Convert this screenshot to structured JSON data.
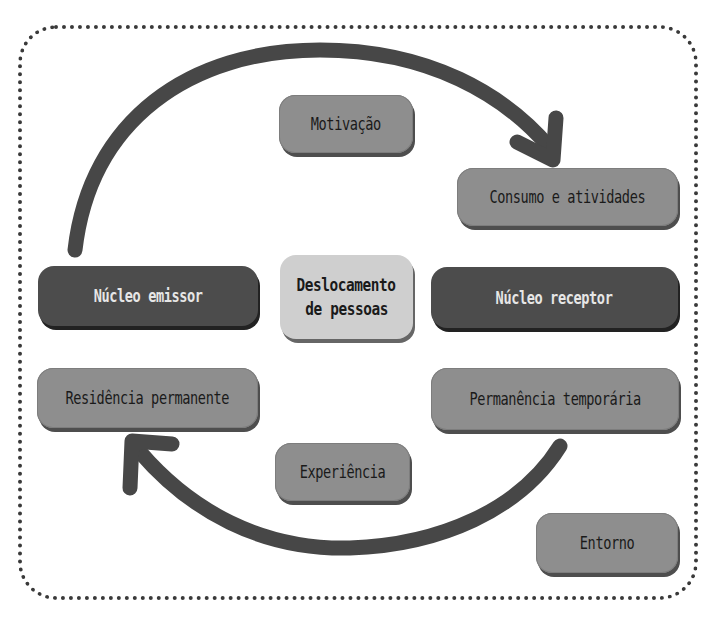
{
  "diagram": {
    "center": {
      "line1": "Deslocamento",
      "line2": "de pessoas"
    },
    "nodes": {
      "motivacao": "Motivação",
      "consumo": "Consumo e atividades",
      "nucleo_emissor": "Núcleo emissor",
      "nucleo_receptor": "Núcleo receptor",
      "residencia": "Residência permanente",
      "permanencia": "Permanência temporária",
      "experiencia": "Experiência",
      "entorno": "Entorno"
    },
    "arrows": [
      {
        "from": "nucleo_emissor",
        "to": "consumo",
        "direction": "clockwise-top"
      },
      {
        "from": "permanencia",
        "to": "residencia",
        "direction": "clockwise-bottom"
      }
    ],
    "colors": {
      "dark_box": "#4c4c4c",
      "mid_box": "#8e8e8e",
      "light_box": "#cfcfcf",
      "arrow": "#474747",
      "border": "#3a3a3a"
    }
  }
}
